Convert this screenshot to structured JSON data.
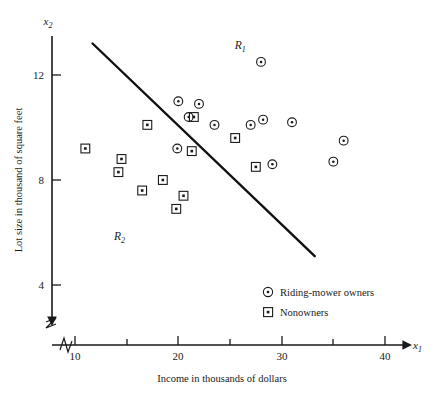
{
  "chart_data": {
    "type": "scatter",
    "title": "",
    "xlabel": "Income in thousands of dollars",
    "ylabel": "Lot size in thousand of square feet",
    "x_var": "x",
    "x_var_sub": "1",
    "y_var": "x",
    "y_var_sub": "2",
    "xlim": [
      8,
      41
    ],
    "ylim": [
      2.6,
      13.6
    ],
    "xticks": [
      10,
      15,
      20,
      25,
      30,
      35,
      40
    ],
    "xtick_labels": [
      "10",
      "",
      "20",
      "",
      "30",
      "",
      "40"
    ],
    "yticks": [
      4,
      8,
      12
    ],
    "ytick_labels": [
      "4",
      "8",
      "12"
    ],
    "grid": false,
    "axis_break": true,
    "legend_position": "lower-right-inside",
    "series": [
      {
        "name": "Riding-mower owners",
        "marker": "circle-dot",
        "points": [
          [
            20.0,
            11.0
          ],
          [
            28.0,
            12.5
          ],
          [
            22.0,
            10.9
          ],
          [
            21.0,
            10.4
          ],
          [
            23.5,
            10.1
          ],
          [
            27.0,
            10.1
          ],
          [
            28.2,
            10.3
          ],
          [
            31.0,
            10.2
          ],
          [
            19.9,
            9.2
          ],
          [
            29.1,
            8.6
          ],
          [
            36.0,
            9.5
          ],
          [
            35.0,
            8.7
          ]
        ]
      },
      {
        "name": "Nonowners",
        "marker": "square-dot",
        "points": [
          [
            21.5,
            10.4
          ],
          [
            17.0,
            10.1
          ],
          [
            11.0,
            9.2
          ],
          [
            25.5,
            9.6
          ],
          [
            14.5,
            8.8
          ],
          [
            21.3,
            9.1
          ],
          [
            14.2,
            8.3
          ],
          [
            27.5,
            8.5
          ],
          [
            18.5,
            8.0
          ],
          [
            16.5,
            7.6
          ],
          [
            20.5,
            7.4
          ],
          [
            19.8,
            6.9
          ]
        ]
      }
    ],
    "annotations": [
      {
        "name": "region-r1",
        "label": "R",
        "sub": "1",
        "x": 26.0,
        "y": 13.0
      },
      {
        "name": "region-r2",
        "label": "R",
        "sub": "2",
        "x": 14.3,
        "y": 5.7
      }
    ],
    "decision_boundary": {
      "name": "linear-discriminant-line",
      "from": [
        11.7,
        13.2
      ],
      "to": [
        33.2,
        5.1
      ]
    }
  },
  "legend": {
    "items": [
      {
        "label": "Riding-mower owners",
        "marker": "circle-dot"
      },
      {
        "label": "Nonowners",
        "marker": "square-dot"
      }
    ]
  }
}
